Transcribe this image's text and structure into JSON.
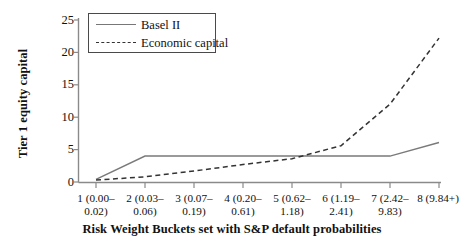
{
  "chart_data": {
    "type": "line",
    "title": "",
    "xlabel": "Risk Weight Buckets set with S&P default probabilities",
    "ylabel": "Tier 1 equity capital",
    "categories": [
      "1 (0.00–\n0.02)",
      "2 (0.03–\n0.06)",
      "3 (0.07–\n0.19)",
      "4 (0.20–\n0.61)",
      "5 (0.62–\n1.18)",
      "6 (1.19–\n2.41)",
      "7 (2.42–\n9.83)",
      "8 (9.84+)"
    ],
    "ylim": [
      0,
      25
    ],
    "yticks": [
      0,
      5,
      10,
      15,
      20,
      25
    ],
    "grid": false,
    "legend_position": "top-left",
    "series": [
      {
        "name": "Basel II",
        "style": "solid",
        "color": "#7a7a7a",
        "values": [
          0.4,
          4.0,
          4.0,
          4.0,
          4.0,
          4.0,
          4.0,
          6.1
        ]
      },
      {
        "name": "Economic capital",
        "style": "dashed",
        "color": "#333333",
        "values": [
          0.3,
          0.8,
          1.7,
          2.7,
          3.6,
          5.6,
          12.0,
          22.2
        ]
      }
    ]
  },
  "axes": {
    "y_tick_labels": [
      "25",
      "20",
      "15",
      "10",
      "5",
      "0"
    ],
    "axis_color": "#8a8a8a"
  },
  "legend": {
    "entries": [
      {
        "label": "Basel II",
        "swatch": "solid-line-swatch"
      },
      {
        "label": "Economic capital",
        "swatch": "dashed-line-swatch"
      }
    ]
  }
}
